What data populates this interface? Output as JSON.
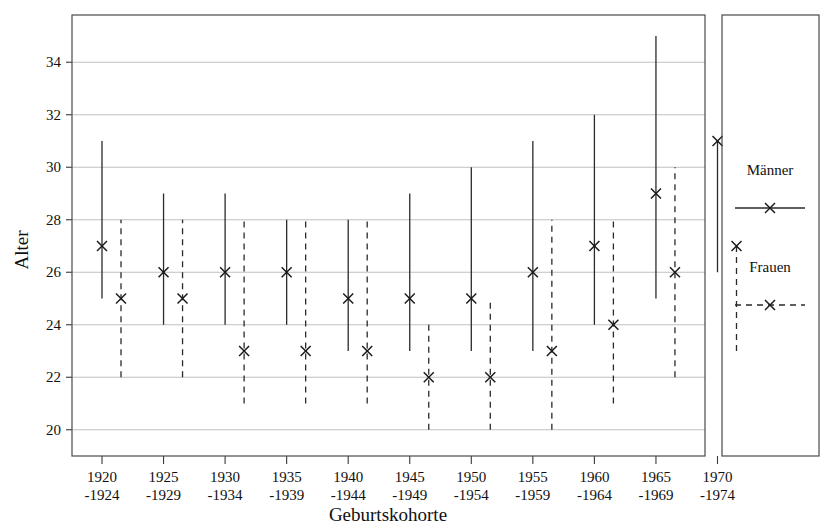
{
  "chart_data": {
    "type": "scatter",
    "title": "",
    "xlabel": "Geburtskohorte",
    "ylabel": "Alter",
    "ylim": [
      19.0,
      35.8
    ],
    "yticks": [
      20,
      22,
      24,
      26,
      28,
      30,
      32,
      34
    ],
    "grid": true,
    "legend_position": "right-outside",
    "categories": [
      "1920\n-1924",
      "1925\n-1929",
      "1930\n-1934",
      "1935\n-1939",
      "1940\n-1944",
      "1945\n-1949",
      "1950\n-1954",
      "1955\n-1959",
      "1960\n-1964",
      "1965\n-1969",
      "1970\n-1974"
    ],
    "category_lines": [
      [
        "1920",
        "-1924"
      ],
      [
        "1925",
        "-1929"
      ],
      [
        "1930",
        "-1934"
      ],
      [
        "1935",
        "-1939"
      ],
      [
        "1940",
        "-1944"
      ],
      [
        "1945",
        "-1949"
      ],
      [
        "1950",
        "-1954"
      ],
      [
        "1955",
        "-1959"
      ],
      [
        "1960",
        "-1964"
      ],
      [
        "1965",
        "-1969"
      ],
      [
        "1970",
        "-1974"
      ]
    ],
    "series": [
      {
        "name": "Männer",
        "style": "solid",
        "marker": "x",
        "values": [
          27,
          26,
          26,
          26,
          25,
          25,
          25,
          26,
          27,
          29,
          31
        ],
        "low": [
          25,
          24,
          24,
          24,
          23,
          23,
          23,
          23,
          24,
          25,
          26
        ],
        "high": [
          31,
          29,
          29,
          28,
          28,
          29,
          30,
          31,
          32,
          35,
          31
        ]
      },
      {
        "name": "Frauen",
        "style": "dashed",
        "marker": "x",
        "values": [
          25,
          25,
          23,
          23,
          23,
          22,
          22,
          23,
          24,
          26,
          27
        ],
        "low": [
          22,
          22,
          21,
          21,
          21,
          20,
          20,
          20,
          21,
          22,
          23
        ],
        "high": [
          28,
          28,
          28,
          28,
          28,
          24,
          25,
          28,
          28,
          30,
          27
        ]
      }
    ]
  },
  "legend": {
    "entries": [
      {
        "label": "Männer",
        "style": "solid"
      },
      {
        "label": "Frauen",
        "style": "dashed"
      }
    ]
  }
}
